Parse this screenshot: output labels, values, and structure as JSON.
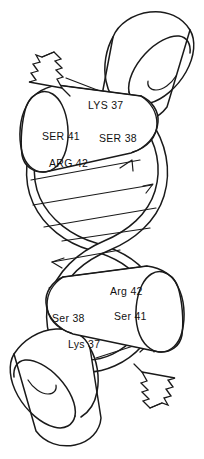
{
  "figure": {
    "kind": "line-art-molecular-diagram",
    "background_color": "#ffffff",
    "ink_color": "#1a1a1a"
  },
  "labels": {
    "upper_monomer": [
      {
        "id": "lys37-upper",
        "text": "LYS 37",
        "x": 88,
        "y": 100
      },
      {
        "id": "ser41-upper",
        "text": "SER 41",
        "x": 42,
        "y": 131
      },
      {
        "id": "ser38-upper",
        "text": "SER 38",
        "x": 99,
        "y": 133
      },
      {
        "id": "arg42-upper",
        "text": "ARG 42",
        "x": 49,
        "y": 158
      }
    ],
    "lower_monomer": [
      {
        "id": "arg42-lower",
        "text": "Arg 42",
        "x": 110,
        "y": 286
      },
      {
        "id": "ser38-lower",
        "text": "Ser 38",
        "x": 52,
        "y": 313
      },
      {
        "id": "ser41-lower",
        "text": "Ser 41",
        "x": 114,
        "y": 311
      },
      {
        "id": "lys37-lower",
        "text": "Lys 37",
        "x": 68,
        "y": 339
      }
    ]
  },
  "shapes": {
    "cylinders": [
      {
        "id": "cylinder-top-right",
        "role": "helix-barrel"
      },
      {
        "id": "cylinder-upper-middle",
        "role": "labeled-helix-barrel"
      },
      {
        "id": "cylinder-lower-middle",
        "role": "labeled-helix-barrel"
      },
      {
        "id": "cylinder-bottom-left",
        "role": "helix-barrel"
      }
    ],
    "termini": [
      {
        "id": "zigzag-upper-left",
        "role": "chain-terminus"
      },
      {
        "id": "zigzag-lower-right",
        "role": "chain-terminus"
      }
    ],
    "ribbons": [
      {
        "id": "ribbon-strand-a",
        "role": "helical-ribbon"
      },
      {
        "id": "ribbon-strand-b",
        "role": "helical-ribbon"
      }
    ]
  }
}
